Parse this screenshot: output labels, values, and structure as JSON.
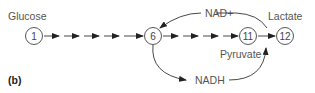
{
  "diagram": {
    "panel_label": "(b)",
    "labels": {
      "glucose": "Glucose",
      "lactate": "Lactate",
      "pyruvate": "Pyruvate",
      "nad_plus": "NAD+",
      "nadh": "NADH"
    },
    "nodes": [
      {
        "id": "1",
        "label": "1"
      },
      {
        "id": "6",
        "label": "6"
      },
      {
        "id": "11",
        "label": "11"
      },
      {
        "id": "12",
        "label": "12"
      }
    ],
    "colors": {
      "line": "#333333",
      "text": "#555555"
    }
  }
}
